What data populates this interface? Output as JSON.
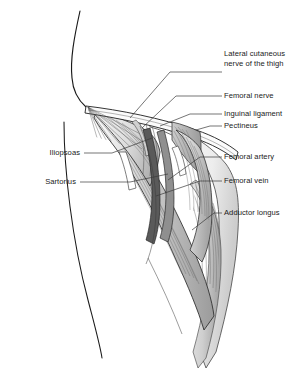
{
  "figure": {
    "view": "anterior right thigh with femoral triangle dissected",
    "width": 307,
    "height": 371,
    "background_color": "#ffffff",
    "line_color": "#1a1a1a",
    "leader_color": "#3a3a3a"
  },
  "labels": {
    "lateral_cutaneous_nerve_line1": "Lateral cutaneous",
    "lateral_cutaneous_nerve_line2": "nerve of the thigh",
    "femoral_nerve": "Femoral nerve",
    "inguinal_ligament": "Inguinal ligament",
    "pectineus": "Pectineus",
    "femoral_artery": "Femoral artery",
    "femoral_vein": "Femoral vein",
    "adductor_longus": "Adductor longus",
    "iliopsoas": "Iliopsoas",
    "sartorius": "Sartorius"
  },
  "structures": [
    {
      "name": "lateral-cutaneous-nerve-of-thigh",
      "label": "Lateral cutaneous nerve of the thigh",
      "side": "right",
      "fill": "#e8e8e8"
    },
    {
      "name": "femoral-nerve",
      "label": "Femoral nerve",
      "side": "right",
      "fill": "#d8d8d8"
    },
    {
      "name": "inguinal-ligament",
      "label": "Inguinal ligament",
      "side": "right",
      "fill": "#f2f2f2"
    },
    {
      "name": "pectineus",
      "label": "Pectineus",
      "side": "right",
      "fill": "#b9b9b9"
    },
    {
      "name": "femoral-artery",
      "label": "Femoral artery",
      "side": "right",
      "fill": "#8e8e8e"
    },
    {
      "name": "femoral-vein",
      "label": "Femoral vein",
      "side": "right",
      "fill": "#5e5e5e"
    },
    {
      "name": "adductor-longus",
      "label": "Adductor longus",
      "side": "right",
      "fill": "#c9c9c9"
    },
    {
      "name": "iliopsoas",
      "label": "Iliopsoas",
      "side": "left",
      "fill": "#cfcfcf"
    },
    {
      "name": "sartorius",
      "label": "Sartorius",
      "side": "left",
      "fill": "#bdbdbd"
    }
  ]
}
